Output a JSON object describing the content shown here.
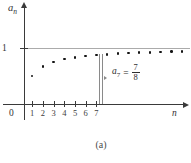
{
  "figure": {
    "caption": "(a)",
    "y_axis_label": {
      "base": "a",
      "sub": "n"
    },
    "x_axis_label": "n",
    "y_tick_label": "1",
    "origin_label": "0",
    "x_tick_labels": [
      "1",
      "2",
      "3",
      "4",
      "5",
      "6",
      "7"
    ],
    "annotation": {
      "var_base": "a",
      "var_sub": "7",
      "equals": "=",
      "frac_num": "7",
      "frac_den": "8"
    }
  },
  "chart_data": {
    "type": "scatter",
    "title": "",
    "xlabel": "n",
    "ylabel": "a_n",
    "x": [
      1,
      2,
      3,
      4,
      5,
      6,
      7,
      8,
      9,
      10,
      11,
      12,
      13,
      14,
      15
    ],
    "values": [
      0.5,
      0.667,
      0.75,
      0.8,
      0.833,
      0.857,
      0.875,
      0.889,
      0.9,
      0.909,
      0.917,
      0.923,
      0.929,
      0.933,
      0.938
    ],
    "x_ticks": [
      1,
      2,
      3,
      4,
      5,
      6,
      7
    ],
    "y_ticks": [
      1
    ],
    "xlim": [
      0,
      15.8
    ],
    "ylim": [
      0,
      1.18
    ],
    "grid": false,
    "reference_line_y": 1,
    "annotated_point": {
      "x": 7,
      "value": 0.875,
      "label": "a_7 = 7/8"
    }
  },
  "colors": {
    "background": "#ffffff",
    "axis": "#3a3a3a",
    "dots": "#141414",
    "limit_line": "#ababab",
    "bracket": "#8a8a8a",
    "text": "#333333"
  }
}
